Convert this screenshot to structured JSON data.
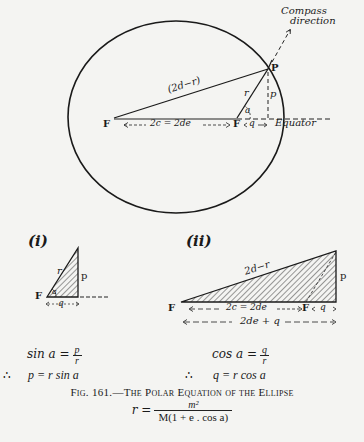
{
  "figure": {
    "number_label": "Fig. 161.",
    "caption_title": "The Polar Equation of the Ellipse",
    "main_diagram": {
      "compass_label_line1": "Compass",
      "compass_label_line2": "direction",
      "point_P": "P",
      "focus_left": "F",
      "focus_right": "F",
      "long_side": "(2d−r)",
      "radius": "r",
      "angle": "a",
      "perpendicular": "p",
      "focal_distance": "2c = 2de",
      "q_label": "q",
      "equator_label": "Equator"
    },
    "diagram_i": {
      "label": "(i)",
      "focus": "F",
      "hyp": "r",
      "angle": "a",
      "opp": "p",
      "adj": "q"
    },
    "diagram_ii": {
      "label": "(ii)",
      "focus_left": "F",
      "focus_right": "F",
      "hyp": "2d−r",
      "opp": "p",
      "focal_distance": "2c = 2de",
      "q_label": "q",
      "base": "2de + q"
    },
    "formulas": {
      "left_line1_lhs": "sin a =",
      "left_line1_num": "p",
      "left_line1_den": "r",
      "left_therefore": "∴",
      "left_line2": "p = r sin a",
      "right_line1_lhs": "cos a =",
      "right_line1_num": "q",
      "right_line1_den": "r",
      "right_therefore": "∴",
      "right_line2": "q = r cos a"
    },
    "equation": {
      "lhs": "r =",
      "numerator": "m²",
      "denominator": "M(1 + e . cos a)"
    }
  },
  "colors": {
    "ink": "#1a1a1a",
    "paper": "#f4f4f2",
    "bleed": "#d9d9d6"
  }
}
